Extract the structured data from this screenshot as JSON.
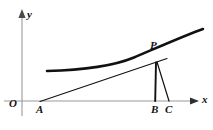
{
  "figure": {
    "type": "math-diagram",
    "background_color": "#ffffff",
    "stroke_color": "#111111",
    "axis_color": "#888888",
    "axes": {
      "y_axis_label": "y",
      "x_axis_label": "x",
      "origin_label": "O",
      "y_axis_x_px": 22,
      "x_axis_y_px": 101,
      "y_axis_top_px": 14,
      "y_axis_bottom_px": 116,
      "x_axis_left_px": 4,
      "x_axis_right_px": 196,
      "arrowheads": [
        "y-top",
        "x-right"
      ]
    },
    "points": [
      {
        "name": "A",
        "label": "A",
        "x_px": 40,
        "y_px": 101,
        "on": "x-axis"
      },
      {
        "name": "B",
        "label": "B",
        "x_px": 155,
        "y_px": 101,
        "on": "x-axis"
      },
      {
        "name": "C",
        "label": "C",
        "x_px": 169,
        "y_px": 101,
        "on": "x-axis"
      },
      {
        "name": "P",
        "label": "P",
        "x_px": 157,
        "y_px": 62,
        "on": "curve"
      }
    ],
    "curve": {
      "name": "exponential-curve",
      "path": "M 47,71 C 80,70 112,66 134,57 C 154,49 182,36 203,29",
      "stroke_width": 2.4
    },
    "segments": [
      {
        "name": "tangent-line-AP",
        "from": "A",
        "to": "P-extended",
        "path": "M 40,101 L 166,59",
        "stroke_width": 1.2
      },
      {
        "name": "segment-PB",
        "from": "P",
        "to": "B",
        "path": "M 156,63 L 155,101",
        "stroke_width": 1.8
      },
      {
        "name": "segment-PC",
        "from": "P",
        "to": "C",
        "path": "M 157,62 L 169,101",
        "stroke_width": 1.2
      }
    ],
    "caption": ""
  }
}
